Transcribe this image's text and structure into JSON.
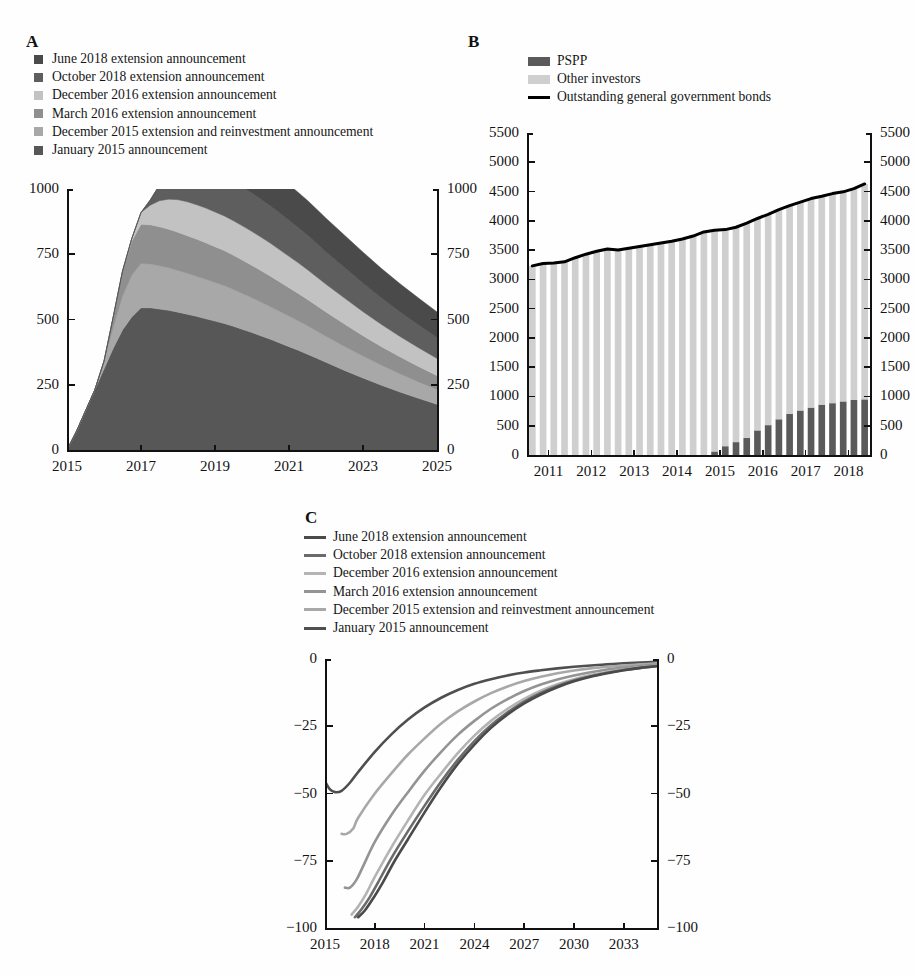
{
  "figure": {
    "panels": [
      "A",
      "B",
      "C"
    ],
    "background": "#fefefe"
  },
  "panelA": {
    "letter": "A",
    "legend": [
      {
        "label": "June 2018 extension announcement",
        "color": "#4a4a4a"
      },
      {
        "label": "October 2018 extension announcement",
        "color": "#5e5e5e"
      },
      {
        "label": "December 2016 extension announcement",
        "color": "#c2c2c2"
      },
      {
        "label": "March 2016 extension announcement",
        "color": "#8f8f8f"
      },
      {
        "label": "December 2015 extension and reinvestment announcement",
        "color": "#a8a8a8"
      },
      {
        "label": "January 2015 announcement",
        "color": "#575757"
      }
    ],
    "yticks": [
      "0",
      "250",
      "500",
      "750",
      "1000"
    ],
    "xticks": [
      "2015",
      "2017",
      "2019",
      "2021",
      "2023",
      "2025"
    ]
  },
  "panelB": {
    "letter": "B",
    "legend": [
      {
        "label": "PSPP",
        "color": "#5a5a5a",
        "kind": "box"
      },
      {
        "label": "Other investors",
        "color": "#cfcfcf",
        "kind": "box"
      },
      {
        "label": "Outstanding general government bonds",
        "color": "#000000",
        "kind": "line"
      }
    ],
    "yticks": [
      "0",
      "500",
      "1000",
      "1500",
      "2000",
      "2500",
      "3000",
      "3500",
      "4000",
      "4500",
      "5000",
      "5500"
    ],
    "xticks": [
      "2011",
      "2012",
      "2013",
      "2014",
      "2015",
      "2016",
      "2017",
      "2018"
    ]
  },
  "panelC": {
    "letter": "C",
    "legend": [
      {
        "label": "June 2018 extension announcement",
        "color": "#4a4a4a"
      },
      {
        "label": "October 2018 extension announcement",
        "color": "#6b6b6b"
      },
      {
        "label": "December 2016 extension announcement",
        "color": "#b4b4b4"
      },
      {
        "label": "March 2016 extension announcement",
        "color": "#949494"
      },
      {
        "label": "December 2015 extension and reinvestment announcement",
        "color": "#a8a8a8"
      },
      {
        "label": "January 2015 announcement",
        "color": "#4f4f4f"
      }
    ],
    "yticks": [
      "0",
      "−25",
      "−50",
      "−75",
      "−100"
    ],
    "xticks": [
      "2015",
      "2018",
      "2021",
      "2024",
      "2027",
      "2030",
      "2033"
    ]
  },
  "chart_data": [
    {
      "type": "area",
      "panel": "A",
      "title": "",
      "xlabel": "",
      "ylabel": "",
      "stacked": true,
      "xlim": [
        2015,
        2025
      ],
      "ylim": [
        0,
        1000
      ],
      "grid": false,
      "legend_position": "above-plot",
      "x": [
        2015.0,
        2015.25,
        2015.5,
        2015.75,
        2016.0,
        2016.25,
        2016.5,
        2016.75,
        2017.0,
        2017.25,
        2017.5,
        2017.75,
        2018.0,
        2018.25,
        2018.5,
        2018.75,
        2019.0,
        2019.25,
        2019.5,
        2019.75,
        2020.0,
        2020.25,
        2020.5,
        2020.75,
        2021.0,
        2021.25,
        2021.5,
        2021.75,
        2022.0,
        2022.5,
        2023.0,
        2023.5,
        2024.0,
        2024.5,
        2025.0
      ],
      "series": [
        {
          "name": "January 2015 announcement",
          "color": "#575757",
          "values": [
            0,
            70,
            150,
            230,
            310,
            390,
            460,
            510,
            545,
            545,
            540,
            535,
            528,
            520,
            512,
            503,
            494,
            485,
            474,
            462,
            450,
            437,
            424,
            410,
            396,
            382,
            367,
            352,
            336,
            305,
            276,
            248,
            222,
            198,
            175
          ]
        },
        {
          "name": "December 2015 extension and reinvestment announcement",
          "color": "#a8a8a8",
          "values": [
            0,
            0,
            0,
            0,
            30,
            80,
            130,
            160,
            170,
            168,
            166,
            163,
            160,
            157,
            154,
            151,
            148,
            145,
            141,
            137,
            133,
            129,
            125,
            121,
            117,
            113,
            109,
            104,
            100,
            92,
            84,
            77,
            70,
            63,
            57
          ]
        },
        {
          "name": "March 2016 extension announcement",
          "color": "#8f8f8f",
          "values": [
            0,
            0,
            0,
            0,
            0,
            40,
            95,
            130,
            150,
            150,
            149,
            148,
            146,
            144,
            142,
            140,
            137,
            134,
            131,
            128,
            124,
            121,
            117,
            113,
            109,
            105,
            101,
            97,
            93,
            86,
            78,
            71,
            65,
            59,
            53
          ]
        },
        {
          "name": "December 2016 extension announcement",
          "color": "#c2c2c2",
          "values": [
            0,
            0,
            0,
            0,
            0,
            0,
            0,
            10,
            45,
            75,
            100,
            115,
            125,
            130,
            132,
            133,
            133,
            133,
            132,
            131,
            130,
            128,
            126,
            123,
            120,
            117,
            114,
            110,
            106,
            99,
            92,
            85,
            78,
            72,
            66
          ]
        },
        {
          "name": "October 2018 extension announcement",
          "color": "#5e5e5e",
          "values": [
            0,
            0,
            0,
            0,
            0,
            0,
            0,
            0,
            0,
            20,
            60,
            95,
            120,
            135,
            142,
            146,
            148,
            149,
            149,
            148,
            147,
            145,
            143,
            141,
            138,
            135,
            132,
            128,
            124,
            117,
            109,
            101,
            94,
            87,
            80
          ]
        },
        {
          "name": "June 2018 extension announcement",
          "color": "#4a4a4a",
          "values": [
            0,
            0,
            0,
            0,
            0,
            0,
            0,
            0,
            0,
            0,
            0,
            34,
            70,
            95,
            112,
            122,
            128,
            132,
            135,
            137,
            138,
            138,
            138,
            137,
            136,
            135,
            133,
            131,
            129,
            124,
            119,
            113,
            108,
            103,
            98
          ]
        }
      ]
    },
    {
      "type": "bar",
      "panel": "B",
      "title": "",
      "xlabel": "",
      "ylabel": "",
      "stacked": true,
      "xlim": [
        2011,
        2019
      ],
      "ylim": [
        0,
        5500
      ],
      "grid": false,
      "legend_position": "above-plot",
      "categories": [
        "2011Q1",
        "2011Q2",
        "2011Q3",
        "2011Q4",
        "2012Q1",
        "2012Q2",
        "2012Q3",
        "2012Q4",
        "2013Q1",
        "2013Q2",
        "2013Q3",
        "2013Q4",
        "2014Q1",
        "2014Q2",
        "2014Q3",
        "2014Q4",
        "2015Q1",
        "2015Q2",
        "2015Q3",
        "2015Q4",
        "2016Q1",
        "2016Q2",
        "2016Q3",
        "2016Q4",
        "2017Q1",
        "2017Q2",
        "2017Q3",
        "2017Q4",
        "2018Q1",
        "2018Q2",
        "2018Q3",
        "2018Q4"
      ],
      "series": [
        {
          "name": "PSPP",
          "color": "#5a5a5a",
          "values": [
            0,
            0,
            0,
            0,
            0,
            0,
            0,
            0,
            0,
            0,
            0,
            0,
            0,
            0,
            0,
            0,
            0,
            60,
            150,
            220,
            290,
            420,
            510,
            610,
            700,
            760,
            810,
            860,
            885,
            915,
            940,
            950
          ]
        },
        {
          "name": "Other investors",
          "color": "#cfcfcf",
          "values": [
            3230,
            3270,
            3280,
            3300,
            3370,
            3430,
            3480,
            3520,
            3500,
            3530,
            3560,
            3590,
            3620,
            3650,
            3690,
            3740,
            3810,
            3780,
            3700,
            3670,
            3670,
            3620,
            3600,
            3580,
            3560,
            3560,
            3570,
            3560,
            3580,
            3580,
            3610,
            3680
          ]
        }
      ],
      "line_overlay": {
        "name": "Outstanding general government bonds",
        "color": "#000000",
        "values": [
          3230,
          3270,
          3280,
          3300,
          3370,
          3430,
          3480,
          3520,
          3500,
          3530,
          3560,
          3590,
          3620,
          3650,
          3690,
          3740,
          3810,
          3840,
          3850,
          3890,
          3960,
          4040,
          4110,
          4190,
          4260,
          4320,
          4380,
          4420,
          4465,
          4495,
          4550,
          4630
        ]
      }
    },
    {
      "type": "line",
      "panel": "C",
      "title": "",
      "xlabel": "",
      "ylabel": "",
      "xlim": [
        2015,
        2035
      ],
      "ylim": [
        -100,
        0
      ],
      "grid": false,
      "legend_position": "above-plot",
      "series": [
        {
          "name": "January 2015 announcement",
          "color": "#4f4f4f",
          "x": [
            2015.0,
            2015.3,
            2015.6,
            2016.0,
            2016.5,
            2017.0,
            2018.0,
            2019.0,
            2020.0,
            2021.0,
            2022.0,
            2023.0,
            2024.0,
            2025.0,
            2026.0,
            2027.0,
            2028.0,
            2029.0,
            2030.0,
            2031.0,
            2032.0,
            2033.0,
            2034.0,
            2035.0
          ],
          "y": [
            -45.5,
            -48.5,
            -49.5,
            -49.0,
            -46.0,
            -42.0,
            -34.5,
            -28.0,
            -22.5,
            -18.0,
            -14.4,
            -11.5,
            -9.2,
            -7.5,
            -6.1,
            -5.0,
            -4.2,
            -3.5,
            -2.9,
            -2.4,
            -2.0,
            -1.6,
            -1.3,
            -1.0
          ]
        },
        {
          "name": "December 2015 extension and reinvestment announcement",
          "color": "#a8a8a8",
          "x": [
            2016.0,
            2016.3,
            2016.7,
            2017.0,
            2018.0,
            2019.0,
            2020.0,
            2021.0,
            2022.0,
            2023.0,
            2024.0,
            2025.0,
            2026.0,
            2027.0,
            2028.0,
            2029.0,
            2030.0,
            2031.0,
            2032.0,
            2033.0,
            2034.0,
            2035.0
          ],
          "y": [
            -65.0,
            -65.0,
            -63.0,
            -59.0,
            -50.0,
            -42.5,
            -35.5,
            -29.5,
            -24.0,
            -19.5,
            -15.8,
            -12.7,
            -10.2,
            -8.2,
            -6.6,
            -5.3,
            -4.3,
            -3.5,
            -2.9,
            -2.4,
            -2.0,
            -1.6
          ]
        },
        {
          "name": "March 2016 extension announcement",
          "color": "#949494",
          "x": [
            2016.2,
            2016.5,
            2016.9,
            2017.3,
            2018.0,
            2019.0,
            2020.0,
            2021.0,
            2022.0,
            2023.0,
            2024.0,
            2025.0,
            2026.0,
            2027.0,
            2028.0,
            2029.0,
            2030.0,
            2031.0,
            2032.0,
            2033.0,
            2034.0,
            2035.0
          ],
          "y": [
            -85.0,
            -85.0,
            -82.0,
            -77.0,
            -68.0,
            -58.0,
            -49.5,
            -41.5,
            -34.5,
            -28.2,
            -23.0,
            -18.5,
            -14.9,
            -11.9,
            -9.5,
            -7.6,
            -6.1,
            -4.9,
            -3.9,
            -3.2,
            -2.6,
            -2.1
          ]
        },
        {
          "name": "December 2016 extension announcement",
          "color": "#b4b4b4",
          "x": [
            2016.6,
            2017.0,
            2017.5,
            2018.0,
            2019.0,
            2020.0,
            2021.0,
            2022.0,
            2023.0,
            2024.0,
            2025.0,
            2026.0,
            2027.0,
            2028.0,
            2029.0,
            2030.0,
            2031.0,
            2032.0,
            2033.0,
            2034.0,
            2035.0
          ],
          "y": [
            -95.0,
            -92.0,
            -87.0,
            -81.0,
            -70.0,
            -60.0,
            -50.5,
            -42.5,
            -35.0,
            -28.5,
            -23.0,
            -18.5,
            -14.8,
            -11.8,
            -9.4,
            -7.5,
            -6.0,
            -4.8,
            -3.9,
            -3.1,
            -2.5
          ]
        },
        {
          "name": "October 2018 extension announcement",
          "color": "#6b6b6b",
          "x": [
            2016.8,
            2017.2,
            2017.7,
            2018.2,
            2019.0,
            2020.0,
            2021.0,
            2022.0,
            2023.0,
            2024.0,
            2025.0,
            2026.0,
            2027.0,
            2028.0,
            2029.0,
            2030.0,
            2031.0,
            2032.0,
            2033.0,
            2034.0,
            2035.0
          ],
          "y": [
            -96.0,
            -93.0,
            -88.5,
            -83.0,
            -74.0,
            -64.0,
            -54.5,
            -45.5,
            -37.5,
            -30.5,
            -24.6,
            -19.8,
            -15.8,
            -12.6,
            -10.0,
            -8.0,
            -6.4,
            -5.1,
            -4.1,
            -3.3,
            -2.6
          ]
        },
        {
          "name": "June 2018 extension announcement",
          "color": "#4a4a4a",
          "x": [
            2017.0,
            2017.4,
            2017.9,
            2018.4,
            2019.2,
            2020.0,
            2021.0,
            2022.0,
            2023.0,
            2024.0,
            2025.0,
            2026.0,
            2027.0,
            2028.0,
            2029.0,
            2030.0,
            2031.0,
            2032.0,
            2033.0,
            2034.0,
            2035.0
          ],
          "y": [
            -96.0,
            -93.5,
            -89.0,
            -84.0,
            -75.0,
            -67.0,
            -57.0,
            -47.5,
            -39.0,
            -31.8,
            -25.6,
            -20.6,
            -16.5,
            -13.2,
            -10.5,
            -8.3,
            -6.6,
            -5.3,
            -4.2,
            -3.3,
            -2.7
          ]
        }
      ]
    }
  ]
}
